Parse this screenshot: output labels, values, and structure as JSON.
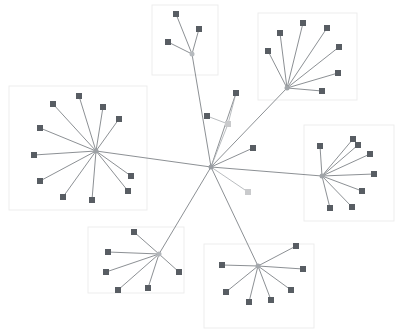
{
  "figure": {
    "title": "",
    "background_color": "#ffffff",
    "width": 399,
    "height": 331
  },
  "style": {
    "node_color": "#585d63",
    "node_color_faded": "#c9cacc",
    "hub_color": "#9a9ea3",
    "edge_color": "#6f7479",
    "edge_color_light": "#a8acb0",
    "cluster_box_stroke": "#ededed",
    "cluster_box_fill": "#ffffff",
    "node_size": 6,
    "hub_size": 5,
    "edge_width": 0.8
  },
  "chart_data": {
    "type": "scatter",
    "title": "",
    "xlabel": "",
    "ylabel": "",
    "xlim": [
      0,
      399
    ],
    "ylim": [
      0,
      331
    ],
    "grid": false,
    "legend": "none",
    "cluster_boxes": [
      {
        "name": "box-cluster-top",
        "x": 152,
        "y": 5,
        "width": 66,
        "height": 70
      },
      {
        "name": "box-cluster-top-right",
        "x": 258,
        "y": 13,
        "width": 99,
        "height": 87
      },
      {
        "name": "box-cluster-left",
        "x": 9,
        "y": 86,
        "width": 138,
        "height": 124
      },
      {
        "name": "box-cluster-right",
        "x": 304,
        "y": 125,
        "width": 90,
        "height": 96
      },
      {
        "name": "box-cluster-bottom-left",
        "x": 88,
        "y": 227,
        "width": 96,
        "height": 66
      },
      {
        "name": "box-cluster-bottom-right",
        "x": 204,
        "y": 244,
        "width": 110,
        "height": 84
      }
    ],
    "nodes": [
      {
        "id": "center-hub",
        "x": 211,
        "y": 167,
        "kind": "hub",
        "color": "#9a9ea3",
        "size": 5
      },
      {
        "id": "h-top",
        "x": 192,
        "y": 54,
        "kind": "hub",
        "color": "#b6babe",
        "size": 5
      },
      {
        "id": "h-top-right",
        "x": 287,
        "y": 88,
        "kind": "hub",
        "color": "#a2a6aa",
        "size": 5
      },
      {
        "id": "h-left",
        "x": 96,
        "y": 151,
        "kind": "hub",
        "color": "#9da1a5",
        "size": 5
      },
      {
        "id": "h-right",
        "x": 322,
        "y": 176,
        "kind": "hub",
        "color": "#a0a4a8",
        "size": 5
      },
      {
        "id": "h-bottom-left",
        "x": 159,
        "y": 254,
        "kind": "hub",
        "color": "#b2b6ba",
        "size": 5
      },
      {
        "id": "h-bottom-right",
        "x": 258,
        "y": 266,
        "kind": "hub",
        "color": "#a3a7ab",
        "size": 5
      },
      {
        "id": "m1",
        "x": 236,
        "y": 93,
        "kind": "leaf",
        "color": "#585d63",
        "size": 6
      },
      {
        "id": "m2",
        "x": 207,
        "y": 116,
        "kind": "leaf",
        "color": "#585d63",
        "size": 6
      },
      {
        "id": "m3",
        "x": 228,
        "y": 124,
        "kind": "leaf-faded",
        "color": "#c9cacc",
        "size": 6
      },
      {
        "id": "m4",
        "x": 253,
        "y": 148,
        "kind": "leaf",
        "color": "#585d63",
        "size": 6
      },
      {
        "id": "m5",
        "x": 248,
        "y": 192,
        "kind": "leaf-faded",
        "color": "#c9cacc",
        "size": 6
      },
      {
        "id": "t1",
        "x": 176,
        "y": 14,
        "kind": "leaf",
        "color": "#585d63",
        "size": 6
      },
      {
        "id": "t2",
        "x": 199,
        "y": 29,
        "kind": "leaf",
        "color": "#585d63",
        "size": 6
      },
      {
        "id": "t3",
        "x": 168,
        "y": 42,
        "kind": "leaf",
        "color": "#585d63",
        "size": 6
      },
      {
        "id": "tr1",
        "x": 303,
        "y": 23,
        "kind": "leaf",
        "color": "#585d63",
        "size": 6
      },
      {
        "id": "tr2",
        "x": 280,
        "y": 33,
        "kind": "leaf",
        "color": "#585d63",
        "size": 6
      },
      {
        "id": "tr3",
        "x": 268,
        "y": 51,
        "kind": "leaf",
        "color": "#585d63",
        "size": 6
      },
      {
        "id": "tr4",
        "x": 327,
        "y": 28,
        "kind": "leaf",
        "color": "#585d63",
        "size": 6
      },
      {
        "id": "tr5",
        "x": 339,
        "y": 47,
        "kind": "leaf",
        "color": "#585d63",
        "size": 6
      },
      {
        "id": "tr6",
        "x": 338,
        "y": 73,
        "kind": "leaf",
        "color": "#585d63",
        "size": 6
      },
      {
        "id": "tr7",
        "x": 322,
        "y": 91,
        "kind": "leaf",
        "color": "#585d63",
        "size": 6
      },
      {
        "id": "l1",
        "x": 79,
        "y": 96,
        "kind": "leaf",
        "color": "#585d63",
        "size": 6
      },
      {
        "id": "l2",
        "x": 53,
        "y": 104,
        "kind": "leaf",
        "color": "#585d63",
        "size": 6
      },
      {
        "id": "l3",
        "x": 103,
        "y": 107,
        "kind": "leaf",
        "color": "#585d63",
        "size": 6
      },
      {
        "id": "l4",
        "x": 119,
        "y": 119,
        "kind": "leaf",
        "color": "#585d63",
        "size": 6
      },
      {
        "id": "l5",
        "x": 40,
        "y": 128,
        "kind": "leaf",
        "color": "#585d63",
        "size": 6
      },
      {
        "id": "l6",
        "x": 34,
        "y": 155,
        "kind": "leaf",
        "color": "#585d63",
        "size": 6
      },
      {
        "id": "l7",
        "x": 40,
        "y": 181,
        "kind": "leaf",
        "color": "#585d63",
        "size": 6
      },
      {
        "id": "l8",
        "x": 63,
        "y": 197,
        "kind": "leaf",
        "color": "#585d63",
        "size": 6
      },
      {
        "id": "l9",
        "x": 92,
        "y": 200,
        "kind": "leaf",
        "color": "#585d63",
        "size": 6
      },
      {
        "id": "l10",
        "x": 128,
        "y": 191,
        "kind": "leaf",
        "color": "#585d63",
        "size": 6
      },
      {
        "id": "l11",
        "x": 131,
        "y": 176,
        "kind": "leaf",
        "color": "#585d63",
        "size": 6
      },
      {
        "id": "r1",
        "x": 320,
        "y": 146,
        "kind": "leaf",
        "color": "#585d63",
        "size": 6
      },
      {
        "id": "r2",
        "x": 353,
        "y": 139,
        "kind": "leaf",
        "color": "#585d63",
        "size": 6
      },
      {
        "id": "r3",
        "x": 358,
        "y": 145,
        "kind": "leaf",
        "color": "#585d63",
        "size": 6
      },
      {
        "id": "r4",
        "x": 370,
        "y": 154,
        "kind": "leaf",
        "color": "#585d63",
        "size": 6
      },
      {
        "id": "r5",
        "x": 374,
        "y": 174,
        "kind": "leaf",
        "color": "#585d63",
        "size": 6
      },
      {
        "id": "r6",
        "x": 362,
        "y": 191,
        "kind": "leaf",
        "color": "#585d63",
        "size": 6
      },
      {
        "id": "r7",
        "x": 352,
        "y": 207,
        "kind": "leaf",
        "color": "#585d63",
        "size": 6
      },
      {
        "id": "r8",
        "x": 330,
        "y": 208,
        "kind": "leaf",
        "color": "#585d63",
        "size": 6
      },
      {
        "id": "bl1",
        "x": 134,
        "y": 232,
        "kind": "leaf",
        "color": "#585d63",
        "size": 6
      },
      {
        "id": "bl2",
        "x": 108,
        "y": 252,
        "kind": "leaf",
        "color": "#585d63",
        "size": 6
      },
      {
        "id": "bl3",
        "x": 106,
        "y": 272,
        "kind": "leaf",
        "color": "#585d63",
        "size": 6
      },
      {
        "id": "bl4",
        "x": 118,
        "y": 290,
        "kind": "leaf",
        "color": "#585d63",
        "size": 6
      },
      {
        "id": "bl5",
        "x": 148,
        "y": 288,
        "kind": "leaf",
        "color": "#585d63",
        "size": 6
      },
      {
        "id": "bl6",
        "x": 179,
        "y": 272,
        "kind": "leaf",
        "color": "#585d63",
        "size": 6
      },
      {
        "id": "br1",
        "x": 296,
        "y": 246,
        "kind": "leaf",
        "color": "#585d63",
        "size": 6
      },
      {
        "id": "br2",
        "x": 222,
        "y": 265,
        "kind": "leaf",
        "color": "#585d63",
        "size": 6
      },
      {
        "id": "br3",
        "x": 303,
        "y": 269,
        "kind": "leaf",
        "color": "#585d63",
        "size": 6
      },
      {
        "id": "br4",
        "x": 226,
        "y": 292,
        "kind": "leaf",
        "color": "#585d63",
        "size": 6
      },
      {
        "id": "br5",
        "x": 249,
        "y": 302,
        "kind": "leaf",
        "color": "#585d63",
        "size": 6
      },
      {
        "id": "br6",
        "x": 271,
        "y": 300,
        "kind": "leaf",
        "color": "#585d63",
        "size": 6
      },
      {
        "id": "br7",
        "x": 291,
        "y": 290,
        "kind": "leaf",
        "color": "#585d63",
        "size": 6
      }
    ],
    "edges": [
      {
        "source": "center-hub",
        "target": "h-top"
      },
      {
        "source": "center-hub",
        "target": "h-top-right"
      },
      {
        "source": "center-hub",
        "target": "h-left"
      },
      {
        "source": "center-hub",
        "target": "h-right"
      },
      {
        "source": "center-hub",
        "target": "h-bottom-left"
      },
      {
        "source": "center-hub",
        "target": "h-bottom-right"
      },
      {
        "source": "center-hub",
        "target": "m1"
      },
      {
        "source": "center-hub",
        "target": "m3"
      },
      {
        "source": "center-hub",
        "target": "m4"
      },
      {
        "source": "center-hub",
        "target": "m5"
      },
      {
        "source": "m3",
        "target": "m2"
      },
      {
        "source": "m3",
        "target": "m1"
      },
      {
        "source": "h-top",
        "target": "t1"
      },
      {
        "source": "h-top",
        "target": "t2"
      },
      {
        "source": "h-top",
        "target": "t3"
      },
      {
        "source": "h-top-right",
        "target": "tr1"
      },
      {
        "source": "h-top-right",
        "target": "tr2"
      },
      {
        "source": "h-top-right",
        "target": "tr3"
      },
      {
        "source": "h-top-right",
        "target": "tr4"
      },
      {
        "source": "h-top-right",
        "target": "tr5"
      },
      {
        "source": "h-top-right",
        "target": "tr6"
      },
      {
        "source": "h-top-right",
        "target": "tr7"
      },
      {
        "source": "h-left",
        "target": "l1"
      },
      {
        "source": "h-left",
        "target": "l2"
      },
      {
        "source": "h-left",
        "target": "l3"
      },
      {
        "source": "h-left",
        "target": "l4"
      },
      {
        "source": "h-left",
        "target": "l5"
      },
      {
        "source": "h-left",
        "target": "l6"
      },
      {
        "source": "h-left",
        "target": "l7"
      },
      {
        "source": "h-left",
        "target": "l8"
      },
      {
        "source": "h-left",
        "target": "l9"
      },
      {
        "source": "h-left",
        "target": "l10"
      },
      {
        "source": "h-left",
        "target": "l11"
      },
      {
        "source": "h-right",
        "target": "r1"
      },
      {
        "source": "h-right",
        "target": "r2"
      },
      {
        "source": "h-right",
        "target": "r3"
      },
      {
        "source": "h-right",
        "target": "r4"
      },
      {
        "source": "h-right",
        "target": "r5"
      },
      {
        "source": "h-right",
        "target": "r6"
      },
      {
        "source": "h-right",
        "target": "r7"
      },
      {
        "source": "h-right",
        "target": "r8"
      },
      {
        "source": "h-bottom-left",
        "target": "bl1"
      },
      {
        "source": "h-bottom-left",
        "target": "bl2"
      },
      {
        "source": "h-bottom-left",
        "target": "bl3"
      },
      {
        "source": "h-bottom-left",
        "target": "bl4"
      },
      {
        "source": "h-bottom-left",
        "target": "bl5"
      },
      {
        "source": "h-bottom-left",
        "target": "bl6"
      },
      {
        "source": "h-bottom-right",
        "target": "br1"
      },
      {
        "source": "h-bottom-right",
        "target": "br2"
      },
      {
        "source": "h-bottom-right",
        "target": "br3"
      },
      {
        "source": "h-bottom-right",
        "target": "br4"
      },
      {
        "source": "h-bottom-right",
        "target": "br5"
      },
      {
        "source": "h-bottom-right",
        "target": "br6"
      },
      {
        "source": "h-bottom-right",
        "target": "br7"
      }
    ]
  }
}
